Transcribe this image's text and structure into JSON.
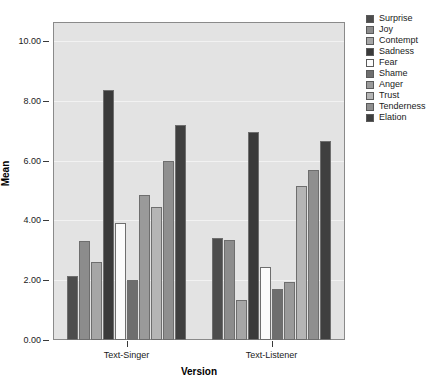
{
  "chart_data": {
    "type": "bar",
    "title": "",
    "xlabel": "Version",
    "ylabel": "Mean",
    "categories": [
      "Text-Singer",
      "Text-Listener"
    ],
    "ylim": [
      0.0,
      10.6
    ],
    "yticks": [
      "0.00",
      "2.00",
      "4.00",
      "6.00",
      "8.00",
      "10.00"
    ],
    "ytick_values": [
      0,
      2,
      4,
      6,
      8,
      10
    ],
    "grid": true,
    "legend_position": "right",
    "series": [
      {
        "name": "Surprise",
        "color": "#4d4d4d",
        "values": [
          2.15,
          3.4
        ]
      },
      {
        "name": "Joy",
        "color": "#8c8c8c",
        "values": [
          3.3,
          3.35
        ]
      },
      {
        "name": "Contempt",
        "color": "#a6a6a6",
        "values": [
          2.6,
          1.35
        ]
      },
      {
        "name": "Sadness",
        "color": "#3a3a3a",
        "values": [
          8.35,
          6.95
        ]
      },
      {
        "name": "Fear",
        "color": "#fbfbfb",
        "values": [
          3.9,
          2.45
        ]
      },
      {
        "name": "Shame",
        "color": "#6e6e6e",
        "values": [
          2.0,
          1.7
        ]
      },
      {
        "name": "Anger",
        "color": "#9a9a9a",
        "values": [
          4.85,
          1.95
        ]
      },
      {
        "name": "Trust",
        "color": "#b5b5b5",
        "values": [
          4.45,
          5.15
        ]
      },
      {
        "name": "Tenderness",
        "color": "#8f8f8f",
        "values": [
          6.0,
          5.7
        ]
      },
      {
        "name": "Elation",
        "color": "#3f3f3f",
        "values": [
          7.2,
          6.65
        ]
      }
    ]
  },
  "legend": {
    "items": [
      {
        "label": "Surprise"
      },
      {
        "label": "Joy"
      },
      {
        "label": "Contempt"
      },
      {
        "label": "Sadness"
      },
      {
        "label": "Fear"
      },
      {
        "label": "Shame"
      },
      {
        "label": "Anger"
      },
      {
        "label": "Trust"
      },
      {
        "label": "Tenderness"
      },
      {
        "label": "Elation"
      }
    ]
  },
  "colors": {
    "plot_background": "#e3e3e3",
    "page_background": "#ffffff",
    "axis": "#3a3a3a",
    "gridline": "#f2f2f2",
    "bar_outline": "#6e6e6e"
  }
}
